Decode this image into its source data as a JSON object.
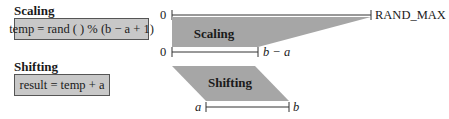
{
  "scaling": {
    "heading": "Scaling",
    "code": "temp = rand ( ) % (b − a + 1)",
    "shape_label": "Scaling"
  },
  "shifting": {
    "heading": "Shifting",
    "code": "result = temp + a",
    "shape_label": "Shifting"
  },
  "axes": {
    "top": {
      "start": "0",
      "end": "RAND_MAX"
    },
    "middle": {
      "start": "0",
      "end": "b − a"
    },
    "bottom": {
      "start": "a",
      "end": "b"
    }
  },
  "colors": {
    "shape_fill": "#a6a6a6",
    "box_fill": "#c8c8c8",
    "line": "#333333"
  }
}
